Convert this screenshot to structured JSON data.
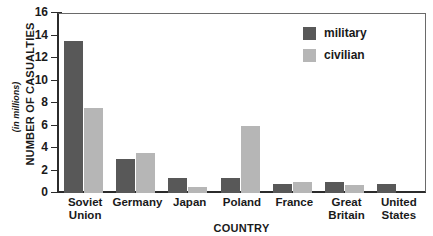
{
  "chart_data": {
    "type": "bar",
    "title": "",
    "xlabel": "COUNTRY",
    "ylabel": "NUMBER OF CASUALTIES",
    "ylabel_note": "(in millions)",
    "ylim": [
      0,
      16
    ],
    "yticks": [
      0,
      2,
      4,
      6,
      8,
      10,
      12,
      14,
      16
    ],
    "grid": false,
    "legend_position": "top-right",
    "categories": [
      "Soviet Union",
      "Germany",
      "Japan",
      "Poland",
      "France",
      "Great Britain",
      "United States"
    ],
    "series": [
      {
        "name": "military",
        "color": "#585858",
        "values": [
          13.5,
          3.0,
          1.3,
          1.3,
          0.8,
          1.0,
          0.8
        ]
      },
      {
        "name": "civilian",
        "color": "#b6b6b6",
        "values": [
          7.6,
          3.6,
          0.5,
          6.0,
          1.0,
          0.7,
          0.0
        ]
      }
    ]
  },
  "axis": {
    "y_labels": [
      "16",
      "14",
      "12",
      "10",
      "8",
      "6",
      "4",
      "2",
      "0"
    ],
    "x_labels": [
      [
        "Soviet",
        "Union"
      ],
      [
        "Germany"
      ],
      [
        "Japan"
      ],
      [
        "Poland"
      ],
      [
        "France"
      ],
      [
        "Great",
        "Britain"
      ],
      [
        "United",
        "States"
      ]
    ]
  },
  "legend": {
    "items": [
      {
        "label": "military",
        "color": "#585858"
      },
      {
        "label": "civilian",
        "color": "#b6b6b6"
      }
    ]
  }
}
